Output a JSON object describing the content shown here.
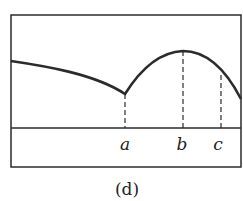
{
  "figure": {
    "caption": "(d)",
    "colors": {
      "stroke": "#2b2b2b",
      "background": "#ffffff"
    },
    "frame": {
      "x1": 11,
      "y1": 15,
      "x2": 241,
      "y2": 167
    },
    "baseline_y": 128,
    "curve_path": "M11,61 C45,66 95,74 125,94 C140,70 160,52 183,51 C205,51 225,68 241,99",
    "markers": [
      {
        "label": "a",
        "x": 125,
        "y_top": 94
      },
      {
        "label": "b",
        "x": 183,
        "y_top": 51
      },
      {
        "label": "c",
        "x": 221,
        "y_top": 75
      }
    ],
    "labels": {
      "a": "a",
      "b": "b",
      "c": "c"
    }
  }
}
